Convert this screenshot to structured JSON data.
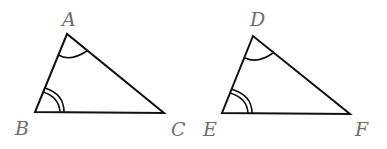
{
  "diagram": {
    "type": "similar-triangles",
    "colors": {
      "line": "#111111",
      "label": "#6e6e6e",
      "background": "#ffffff"
    },
    "triangles": [
      {
        "name": "ABC",
        "vertices": {
          "A": {
            "label": "A",
            "x": 67,
            "y": 34
          },
          "B": {
            "label": "B",
            "x": 35,
            "y": 112
          },
          "C": {
            "label": "C",
            "x": 164,
            "y": 113
          }
        },
        "angle_marks": {
          "A": "single-arc",
          "B": "double-arc"
        }
      },
      {
        "name": "DEF",
        "vertices": {
          "D": {
            "label": "D",
            "x": 253,
            "y": 36
          },
          "E": {
            "label": "E",
            "x": 222,
            "y": 113
          },
          "F": {
            "label": "F",
            "x": 350,
            "y": 114
          }
        },
        "angle_marks": {
          "D": "single-arc",
          "E": "double-arc"
        }
      }
    ]
  }
}
